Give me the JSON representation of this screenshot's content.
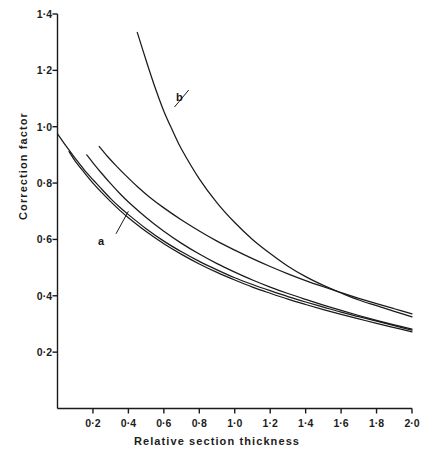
{
  "chart_data": {
    "type": "line",
    "title": "",
    "xlabel": "Relative section thickness",
    "ylabel": "Correction factor",
    "xlim": [
      0,
      2.0
    ],
    "ylim": [
      0,
      1.4
    ],
    "grid": false,
    "legend_position": "inline-annotations",
    "x_tick_labels": [
      "0·2",
      "0·4",
      "0·6",
      "0·8",
      "1·0",
      "1·2",
      "1·4",
      "1·6",
      "1·8",
      "2·0"
    ],
    "x_tick_values": [
      0.2,
      0.4,
      0.6,
      0.8,
      1.0,
      1.2,
      1.4,
      1.6,
      1.8,
      2.0
    ],
    "y_tick_labels": [
      "0·2",
      "0·4",
      "0·6",
      "0·8",
      "1·0",
      "1·2",
      "1·4"
    ],
    "y_tick_values": [
      0.2,
      0.4,
      0.6,
      0.8,
      1.0,
      1.2,
      1.4
    ],
    "annotations": [
      {
        "text": "a",
        "x": 0.33,
        "y": 0.62,
        "points_to_x": 0.4,
        "points_to_y": 0.7
      },
      {
        "text": "b",
        "x": 0.74,
        "y": 1.13,
        "points_to_x": 0.66,
        "points_to_y": 1.07
      }
    ],
    "series": [
      {
        "name": "b",
        "label": "b",
        "color": "#1a1a1a",
        "x": [
          0.45,
          0.5,
          0.55,
          0.6,
          0.65,
          0.7,
          0.8,
          0.9,
          1.0,
          1.1,
          1.2,
          1.3,
          1.4,
          1.5,
          1.6,
          1.7,
          1.8,
          1.9,
          2.0
        ],
        "y": [
          1.335,
          1.235,
          1.14,
          1.055,
          0.985,
          0.92,
          0.815,
          0.73,
          0.66,
          0.6,
          0.55,
          0.505,
          0.468,
          0.437,
          0.41,
          0.385,
          0.365,
          0.345,
          0.325
        ]
      },
      {
        "name": "a",
        "label": "a",
        "color": "#1a1a1a",
        "x": [
          0.0,
          0.05,
          0.1,
          0.15,
          0.2,
          0.25,
          0.3,
          0.35,
          0.4,
          0.5,
          0.6,
          0.7,
          0.8,
          0.9,
          1.0,
          1.1,
          1.2,
          1.3,
          1.4,
          1.5,
          1.6,
          1.7,
          1.8,
          1.9,
          2.0
        ],
        "y": [
          0.975,
          0.93,
          0.888,
          0.848,
          0.812,
          0.778,
          0.745,
          0.715,
          0.688,
          0.638,
          0.594,
          0.556,
          0.522,
          0.492,
          0.464,
          0.44,
          0.418,
          0.397,
          0.378,
          0.36,
          0.342,
          0.326,
          0.31,
          0.294,
          0.278
        ]
      },
      {
        "name": "curve-2",
        "label": "",
        "color": "#1a1a1a",
        "x": [
          0.065,
          0.1,
          0.15,
          0.2,
          0.25,
          0.3,
          0.35,
          0.4,
          0.5,
          0.6,
          0.7,
          0.8,
          0.9,
          1.0,
          1.1,
          1.2,
          1.3,
          1.4,
          1.5,
          1.6,
          1.7,
          1.8,
          1.9,
          2.0
        ],
        "y": [
          0.912,
          0.878,
          0.838,
          0.8,
          0.766,
          0.734,
          0.704,
          0.677,
          0.628,
          0.585,
          0.547,
          0.513,
          0.483,
          0.456,
          0.431,
          0.409,
          0.388,
          0.369,
          0.351,
          0.334,
          0.318,
          0.302,
          0.287,
          0.272
        ]
      },
      {
        "name": "curve-3",
        "label": "",
        "color": "#1a1a1a",
        "x": [
          0.165,
          0.2,
          0.25,
          0.3,
          0.35,
          0.4,
          0.5,
          0.6,
          0.7,
          0.8,
          0.9,
          1.0,
          1.1,
          1.2,
          1.3,
          1.4,
          1.5,
          1.6,
          1.7,
          1.8,
          1.9,
          2.0
        ],
        "y": [
          0.9,
          0.872,
          0.834,
          0.798,
          0.764,
          0.733,
          0.678,
          0.629,
          0.586,
          0.548,
          0.514,
          0.484,
          0.456,
          0.431,
          0.408,
          0.387,
          0.367,
          0.348,
          0.33,
          0.313,
          0.297,
          0.282
        ]
      },
      {
        "name": "curve-4",
        "label": "",
        "color": "#1a1a1a",
        "x": [
          0.235,
          0.28,
          0.33,
          0.38,
          0.45,
          0.52,
          0.6,
          0.7,
          0.8,
          0.9,
          1.0,
          1.1,
          1.2,
          1.3,
          1.4,
          1.5,
          1.6,
          1.7,
          1.8,
          1.9,
          2.0
        ],
        "y": [
          0.93,
          0.896,
          0.862,
          0.83,
          0.788,
          0.75,
          0.712,
          0.669,
          0.63,
          0.594,
          0.562,
          0.532,
          0.504,
          0.478,
          0.454,
          0.432,
          0.411,
          0.391,
          0.372,
          0.354,
          0.336
        ]
      }
    ]
  },
  "axes": {
    "x_title": "Relative section thickness",
    "y_title": "Correction factor"
  },
  "ticks": {
    "x": [
      {
        "label": "0·2"
      },
      {
        "label": "0·4"
      },
      {
        "label": "0·6"
      },
      {
        "label": "0·8"
      },
      {
        "label": "1·0"
      },
      {
        "label": "1·2"
      },
      {
        "label": "1·4"
      },
      {
        "label": "1·6"
      },
      {
        "label": "1·8"
      },
      {
        "label": "2·0"
      }
    ],
    "y": [
      {
        "label": "0·2"
      },
      {
        "label": "0·4"
      },
      {
        "label": "0·6"
      },
      {
        "label": "0·8"
      },
      {
        "label": "1·0"
      },
      {
        "label": "1·2"
      },
      {
        "label": "1·4"
      }
    ]
  },
  "annotations": {
    "a": "a",
    "b": "b"
  },
  "colors": {
    "background": "#ffffff",
    "axis": "#1a1a1a",
    "curve": "#1a1a1a",
    "text": "#1c1c1c"
  }
}
